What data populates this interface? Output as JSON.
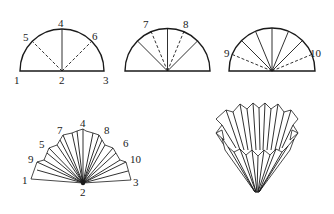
{
  "figure": {
    "steps": [
      {
        "id": "step-1",
        "shape": "semicircle",
        "labels": [
          "1",
          "2",
          "3",
          "4",
          "5",
          "6"
        ],
        "solid_folds": [
          "2-4"
        ],
        "dashed_folds": [
          "2-5",
          "2-6"
        ]
      },
      {
        "id": "step-2",
        "shape": "semicircle",
        "labels": [
          "7",
          "8"
        ],
        "solid_folds": [
          "2-5",
          "2-4",
          "2-6"
        ],
        "dashed_folds": [
          "2-7",
          "2-8"
        ]
      },
      {
        "id": "step-3",
        "shape": "semicircle",
        "labels": [
          "9",
          "10"
        ],
        "solid_folds": [
          "2-5",
          "2-7",
          "2-4",
          "2-8",
          "2-6"
        ],
        "dashed_folds": [
          "2-9",
          "2-10"
        ]
      },
      {
        "id": "step-4",
        "shape": "pleated-fan",
        "labels": [
          "1",
          "9",
          "5",
          "7",
          "4",
          "8",
          "6",
          "10",
          "3",
          "2"
        ]
      },
      {
        "id": "step-5",
        "shape": "opened-fluted-cone",
        "labels": []
      }
    ]
  },
  "labels": {
    "s1": {
      "p1": "1",
      "p2": "2",
      "p3": "3",
      "p4": "4",
      "p5": "5",
      "p6": "6"
    },
    "s2": {
      "p7": "7",
      "p8": "8"
    },
    "s3": {
      "p9": "9",
      "p10": "10"
    },
    "s4": {
      "p1": "1",
      "p9": "9",
      "p5": "5",
      "p7": "7",
      "p4": "4",
      "p8": "8",
      "p6": "6",
      "p10": "10",
      "p3": "3",
      "p2": "2"
    }
  },
  "colors": {
    "ink": "#1a1a1a",
    "background": "#ffffff"
  }
}
